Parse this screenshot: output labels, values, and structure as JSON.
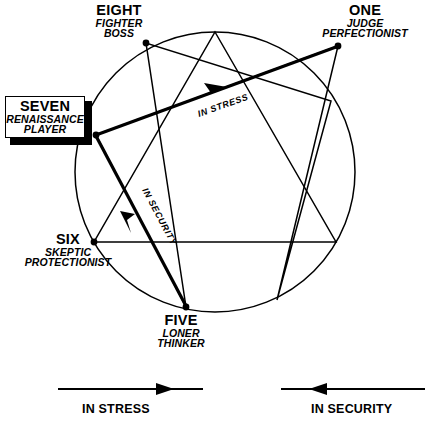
{
  "colors": {
    "ink": "#000000",
    "background": "#ffffff"
  },
  "diagram": {
    "type": "enneagram",
    "circle": {
      "cx": 215,
      "cy": 172,
      "r": 140
    },
    "highlighted_points": [
      {
        "id": "eight",
        "number": "EIGHT",
        "traits": [
          "FIGHTER",
          "BOSS"
        ]
      },
      {
        "id": "one",
        "number": "ONE",
        "traits": [
          "JUDGE",
          "PERFECTIONIST"
        ]
      },
      {
        "id": "seven",
        "number": "SEVEN",
        "traits": [
          "RENAISSANCE",
          "PLAYER"
        ],
        "boxed": true
      },
      {
        "id": "six",
        "number": "SIX",
        "traits": [
          "SKEPTIC",
          "PROTECTIONIST"
        ]
      },
      {
        "id": "five",
        "number": "FIVE",
        "traits": [
          "LONER",
          "THINKER"
        ]
      }
    ],
    "flow_arrows": [
      {
        "id": "in-stress",
        "label": "IN  STRESS",
        "from": "seven",
        "to": "one"
      },
      {
        "id": "in-security",
        "label": "IN SECURITY",
        "from": "five",
        "to": "seven"
      }
    ]
  },
  "labels": {
    "eight": {
      "number": "EIGHT",
      "line1": "FIGHTER",
      "line2": "BOSS"
    },
    "one": {
      "number": "ONE",
      "line1": "JUDGE",
      "line2": "PERFECTIONIST"
    },
    "seven": {
      "number": "SEVEN",
      "line1": "RENAISSANCE",
      "line2": "PLAYER"
    },
    "six": {
      "number": "SIX",
      "line1": "SKEPTIC",
      "line2": "PROTECTIONIST"
    },
    "five": {
      "number": "FIVE",
      "line1": "LONER",
      "line2": "THINKER"
    }
  },
  "flow_labels": {
    "in_stress": "IN  STRESS",
    "in_security": "IN SECURITY"
  },
  "legend": {
    "stress": {
      "caption": "IN STRESS",
      "direction": "right"
    },
    "security": {
      "caption": "IN SECURITY",
      "direction": "left"
    }
  }
}
